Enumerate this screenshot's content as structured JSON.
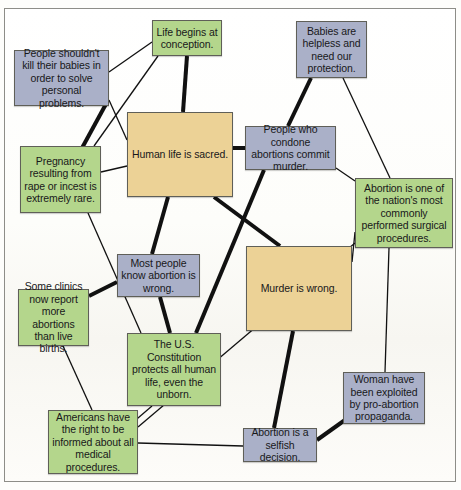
{
  "diagram": {
    "colors": {
      "green": "#b4d68c",
      "blue": "#aab0c8",
      "tan": "#ecd296",
      "edge": "#111111",
      "border": "#5f5f58"
    },
    "nodes": [
      {
        "id": "life-begins",
        "label": "Life begins at conception.",
        "color": "green",
        "x": 152,
        "y": 20,
        "w": 70,
        "h": 36
      },
      {
        "id": "people-shouldnt",
        "label": "People shouldn't kill their babies in order to solve personal problems.",
        "color": "blue",
        "x": 14,
        "y": 50,
        "w": 95,
        "h": 56
      },
      {
        "id": "babies-helpless",
        "label": "Babies are helpless and need our protection.",
        "color": "blue",
        "x": 296,
        "y": 21,
        "w": 71,
        "h": 57
      },
      {
        "id": "human-life",
        "label": "Human life is sacred.",
        "color": "tan",
        "x": 127,
        "y": 112,
        "w": 106,
        "h": 85
      },
      {
        "id": "condone-abortions",
        "label": "People who condone abortions commit murder.",
        "color": "blue",
        "x": 245,
        "y": 126,
        "w": 91,
        "h": 44
      },
      {
        "id": "pregnancy-rape",
        "label": "Pregnancy resulting from rape or incest is extremely rare.",
        "color": "green",
        "x": 20,
        "y": 146,
        "w": 81,
        "h": 67
      },
      {
        "id": "surgical-proc",
        "label": "Abortion is one of the nation's most commonly performed surgical procedures.",
        "color": "green",
        "x": 355,
        "y": 178,
        "w": 98,
        "h": 70
      },
      {
        "id": "most-people",
        "label": "Most people know abortion is wrong.",
        "color": "blue",
        "x": 117,
        "y": 254,
        "w": 83,
        "h": 43
      },
      {
        "id": "murder-wrong",
        "label": "Murder is wrong.",
        "color": "tan",
        "x": 246,
        "y": 246,
        "w": 106,
        "h": 85
      },
      {
        "id": "some-clinics",
        "label": "Some clinics now report more abortions than live births.",
        "color": "green",
        "x": 18,
        "y": 289,
        "w": 71,
        "h": 57
      },
      {
        "id": "us-constitution",
        "label": "The U.S. Constitution protects all human life, even the unborn.",
        "color": "green",
        "x": 127,
        "y": 333,
        "w": 94,
        "h": 73
      },
      {
        "id": "woman-exploited",
        "label": "Woman have been exploited by pro-abortion propaganda.",
        "color": "blue",
        "x": 343,
        "y": 372,
        "w": 82,
        "h": 52
      },
      {
        "id": "americans-right",
        "label": "Americans have the right to be informed about all medical procedures.",
        "color": "green",
        "x": 48,
        "y": 410,
        "w": 90,
        "h": 64
      },
      {
        "id": "selfish-decision",
        "label": "Abortion is a selfish decision.",
        "color": "blue",
        "x": 243,
        "y": 428,
        "w": 74,
        "h": 34
      }
    ],
    "edges": [
      {
        "from": "life-begins",
        "to": "people-shouldnt",
        "weight": "thin",
        "x1": 152,
        "y1": 42,
        "x2": 109,
        "y2": 72
      },
      {
        "from": "life-begins",
        "to": "human-life",
        "weight": "thick",
        "x1": 187,
        "y1": 56,
        "x2": 183,
        "y2": 112
      },
      {
        "from": "life-begins",
        "to": "pregnancy-rape",
        "weight": "thin",
        "x1": 158,
        "y1": 56,
        "x2": 94,
        "y2": 146
      },
      {
        "from": "people-shouldnt",
        "to": "human-life",
        "weight": "thin",
        "x1": 109,
        "y1": 100,
        "x2": 127,
        "y2": 140
      },
      {
        "from": "people-shouldnt",
        "to": "pregnancy-rape",
        "weight": "thick",
        "x1": 106,
        "y1": 104,
        "x2": 82,
        "y2": 148
      },
      {
        "from": "pregnancy-rape",
        "to": "human-life",
        "weight": "thin",
        "x1": 101,
        "y1": 172,
        "x2": 127,
        "y2": 166
      },
      {
        "from": "pregnancy-rape",
        "to": "us-constitution",
        "weight": "thin",
        "x1": 88,
        "y1": 213,
        "x2": 141,
        "y2": 333
      },
      {
        "from": "babies-helpless",
        "to": "condone-abortions",
        "weight": "thick",
        "x1": 311,
        "y1": 78,
        "x2": 288,
        "y2": 126
      },
      {
        "from": "babies-helpless",
        "to": "surgical-proc",
        "weight": "thin",
        "x1": 343,
        "y1": 78,
        "x2": 390,
        "y2": 178
      },
      {
        "from": "human-life",
        "to": "condone-abortions",
        "weight": "thick",
        "x1": 233,
        "y1": 148,
        "x2": 245,
        "y2": 148
      },
      {
        "from": "human-life",
        "to": "most-people",
        "weight": "thick",
        "x1": 168,
        "y1": 197,
        "x2": 152,
        "y2": 254
      },
      {
        "from": "human-life",
        "to": "murder-wrong",
        "weight": "thick",
        "x1": 214,
        "y1": 197,
        "x2": 280,
        "y2": 246
      },
      {
        "from": "condone-abortions",
        "to": "surgical-proc",
        "weight": "thin",
        "x1": 336,
        "y1": 168,
        "x2": 355,
        "y2": 181
      },
      {
        "from": "condone-abortions",
        "to": "us-constitution",
        "weight": "thick",
        "x1": 264,
        "y1": 170,
        "x2": 196,
        "y2": 333
      },
      {
        "from": "surgical-proc",
        "to": "murder-wrong",
        "weight": "thin",
        "x1": 355,
        "y1": 232,
        "x2": 352,
        "y2": 262
      },
      {
        "from": "surgical-proc",
        "to": "woman-exploited",
        "weight": "thin",
        "x1": 389,
        "y1": 248,
        "x2": 385,
        "y2": 372
      },
      {
        "from": "surgical-proc",
        "to": "americans-right",
        "weight": "thin",
        "x1": 355,
        "y1": 243,
        "x2": 138,
        "y2": 427
      },
      {
        "from": "most-people",
        "to": "some-clinics",
        "weight": "thick",
        "x1": 117,
        "y1": 282,
        "x2": 89,
        "y2": 296
      },
      {
        "from": "most-people",
        "to": "us-constitution",
        "weight": "thick",
        "x1": 160,
        "y1": 297,
        "x2": 170,
        "y2": 333
      },
      {
        "from": "some-clinics",
        "to": "americans-right",
        "weight": "thin",
        "x1": 63,
        "y1": 346,
        "x2": 92,
        "y2": 410
      },
      {
        "from": "us-constitution",
        "to": "americans-right",
        "weight": "thin",
        "x1": 152,
        "y1": 406,
        "x2": 131,
        "y2": 424
      },
      {
        "from": "murder-wrong",
        "to": "selfish-decision",
        "weight": "thick",
        "x1": 293,
        "y1": 331,
        "x2": 274,
        "y2": 428
      },
      {
        "from": "selfish-decision",
        "to": "woman-exploited",
        "weight": "thick",
        "x1": 317,
        "y1": 440,
        "x2": 345,
        "y2": 420
      },
      {
        "from": "selfish-decision",
        "to": "americans-right",
        "weight": "thin",
        "x1": 243,
        "y1": 446,
        "x2": 138,
        "y2": 443
      }
    ]
  }
}
